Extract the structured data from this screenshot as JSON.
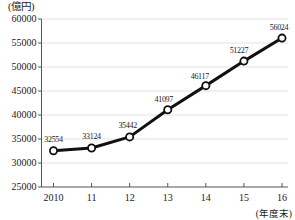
{
  "chart_data": {
    "type": "line",
    "title": "",
    "unit_label": "(億円)",
    "xlabel": "(年度末)",
    "ylabel": "",
    "categories": [
      "2010",
      "11",
      "12",
      "13",
      "14",
      "15",
      "16"
    ],
    "values": [
      32554,
      33124,
      35442,
      41097,
      46117,
      51227,
      56024
    ],
    "point_labels": [
      "32554",
      "33124",
      "35442",
      "41097",
      "46117",
      "51227",
      "56024"
    ],
    "ylim": [
      25000,
      60000
    ],
    "yticks": [
      25000,
      30000,
      35000,
      40000,
      45000,
      50000,
      55000,
      60000
    ],
    "ytick_labels": [
      "25000",
      "30000",
      "35000",
      "40000",
      "45000",
      "50000",
      "55000",
      "60000"
    ],
    "grid": true,
    "legend": "none",
    "series": [
      {
        "name": "",
        "values": [
          32554,
          33124,
          35442,
          41097,
          46117,
          51227,
          56024
        ]
      }
    ],
    "colors": {
      "line": "#111111",
      "marker_fill": "#ffffff",
      "marker_stroke": "#111111",
      "grid": "#e2e2e2",
      "axis": "#555555",
      "text": "#1a1a1a",
      "background": "#ffffff"
    }
  }
}
